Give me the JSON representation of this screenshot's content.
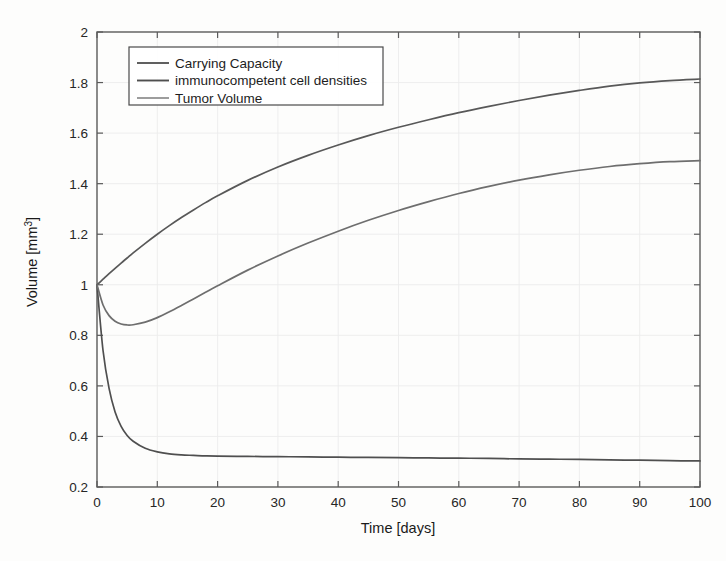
{
  "chart_data": {
    "type": "line",
    "title": "",
    "xlabel": "Time [days]",
    "ylabel": "Volume [mm^3]",
    "ylabel_display": "Volume [mm",
    "ylabel_exponent": "3",
    "ylabel_tail": "]",
    "xlim": [
      0,
      100
    ],
    "ylim": [
      0.2,
      2
    ],
    "xticks": [
      0,
      10,
      20,
      30,
      40,
      50,
      60,
      70,
      80,
      90,
      100
    ],
    "xtick_labels": [
      "0",
      "10",
      "20",
      "30",
      "40",
      "50",
      "60",
      "70",
      "80",
      "90",
      "100"
    ],
    "yticks": [
      0.2,
      0.4,
      0.6,
      0.8,
      1,
      1.2,
      1.4,
      1.6,
      1.8,
      2
    ],
    "ytick_labels": [
      "0.2",
      "0.4",
      "0.6",
      "0.8",
      "1",
      "1.2",
      "1.4",
      "1.6",
      "1.8",
      "2"
    ],
    "grid": true,
    "legend_position": "upper-left",
    "x": [
      0,
      1,
      2,
      3,
      4,
      5,
      6,
      8,
      10,
      12,
      14,
      16,
      18,
      20,
      25,
      30,
      35,
      40,
      45,
      50,
      55,
      60,
      65,
      70,
      75,
      80,
      85,
      90,
      95,
      100
    ],
    "series": [
      {
        "name": "Carrying Capacity",
        "color": "#585858",
        "linewidth": 1.7,
        "values": [
          1.0,
          1.022,
          1.044,
          1.065,
          1.086,
          1.106,
          1.126,
          1.164,
          1.2,
          1.234,
          1.266,
          1.296,
          1.325,
          1.352,
          1.413,
          1.466,
          1.512,
          1.553,
          1.59,
          1.623,
          1.653,
          1.681,
          1.706,
          1.729,
          1.75,
          1.769,
          1.786,
          1.799,
          1.808,
          1.814
        ]
      },
      {
        "name": "immunocompetent cell densities",
        "color": "#4f4f4f",
        "linewidth": 1.7,
        "values": [
          1.0,
          0.74,
          0.59,
          0.497,
          0.44,
          0.404,
          0.381,
          0.353,
          0.339,
          0.331,
          0.327,
          0.325,
          0.323,
          0.322,
          0.321,
          0.32,
          0.319,
          0.318,
          0.317,
          0.316,
          0.315,
          0.314,
          0.313,
          0.311,
          0.31,
          0.309,
          0.307,
          0.306,
          0.304,
          0.303
        ]
      },
      {
        "name": "Tumor Volume",
        "color": "#6e6e6e",
        "linewidth": 1.7,
        "values": [
          1.0,
          0.92,
          0.878,
          0.856,
          0.845,
          0.841,
          0.842,
          0.852,
          0.87,
          0.893,
          0.918,
          0.944,
          0.97,
          0.996,
          1.058,
          1.114,
          1.165,
          1.212,
          1.255,
          1.294,
          1.329,
          1.361,
          1.389,
          1.414,
          1.435,
          1.453,
          1.468,
          1.479,
          1.487,
          1.491
        ]
      }
    ],
    "legend_entries": [
      {
        "label": "Carrying Capacity",
        "color": "#585858"
      },
      {
        "label": "immunocompetent cell densities",
        "color": "#4f4f4f"
      },
      {
        "label": "Tumor Volume",
        "color": "#989898"
      }
    ]
  }
}
